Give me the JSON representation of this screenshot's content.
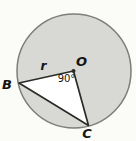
{
  "figure": {
    "kind": "geometry-diagram",
    "labels": {
      "center": "O",
      "radius": "r",
      "central_angle": "90°",
      "point_b": "B",
      "point_c": "C"
    },
    "colors": {
      "background": "#fbfbf8",
      "circle_fill": "#d8d8d5",
      "circle_stroke": "#7d7d7a",
      "triangle_fill": "#ffffff",
      "line": "#2b2b28",
      "text": "#141412"
    }
  }
}
